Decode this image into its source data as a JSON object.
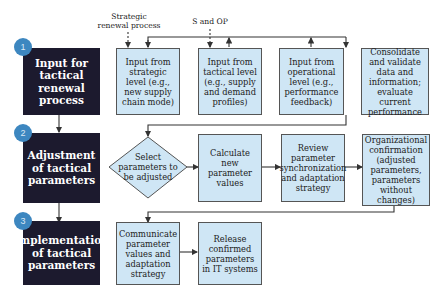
{
  "phases": [
    {
      "number": "1",
      "label": "Input for tactical renewal process"
    },
    {
      "number": "2",
      "label": "Adjustment of tactical parameters"
    },
    {
      "number": "3",
      "label": "Implementation of tactical parameters"
    }
  ],
  "annotations": {
    "strategic_renewal": "Strategic renewal process",
    "s_and_op": "S and OP"
  },
  "row1": [
    {
      "label": "Input from strategic level (e.g., new supply chain mode)"
    },
    {
      "label": "Input from tactical level (e.g., supply and demand profiles)"
    },
    {
      "label": "Input from operational level (e.g., performance feedback)"
    },
    {
      "label": "Consolidate and validate data and information; evaluate current performance"
    }
  ],
  "row2": [
    {
      "label": "Select parameters to be adjusted",
      "shape": "diamond"
    },
    {
      "label": "Calculate new parameter values"
    },
    {
      "label": "Review parameter synchronization and adaptation strategy"
    },
    {
      "label": "Organizational confirmation (adjusted parameters, parameters without changes)"
    }
  ],
  "row3": [
    {
      "label": "Communicate parameter values and adaptation strategy"
    },
    {
      "label": "Release confirmed parameters in IT systems"
    }
  ],
  "colors": {
    "phase_bg": "#1c1a2e",
    "badge": "#3d87c0",
    "box_fill": "#cfe6f5",
    "line": "#333333"
  }
}
